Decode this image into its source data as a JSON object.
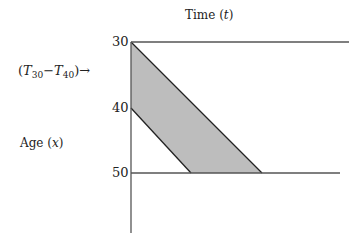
{
  "x_axis_title": "Time",
  "x_axis_var": "t",
  "y_axis_title": "Age",
  "y_axis_var": "x",
  "ticks": [
    "30",
    "40",
    "50"
  ],
  "cohort_label": {
    "open": "(",
    "T": "T",
    "sub1": "30",
    "minus": "−",
    "sub2": "40",
    "close": ")",
    "arrow": "→"
  },
  "colors": {
    "line": "#333333",
    "shade": "#bdbdbd"
  },
  "shaded_region": [
    [
      131,
      42
    ],
    [
      262,
      173
    ],
    [
      191,
      173
    ],
    [
      131,
      108
    ]
  ]
}
